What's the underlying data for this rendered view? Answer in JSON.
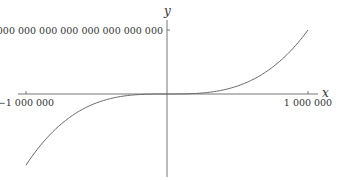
{
  "chart_data": {
    "type": "line",
    "title": "",
    "xlabel": "x",
    "ylabel": "y",
    "function": "y = c * x^3 (odd cubic-like curve)",
    "xlim": [
      -1000000,
      1000000
    ],
    "x_ticks": [
      {
        "value": -1000000,
        "label": "−1 000 000"
      },
      {
        "value": 1000000,
        "label": "1 000 000"
      }
    ],
    "y_ticks": [
      {
        "value": 900000000000000000000000000000,
        "label": "900 000 000 000 000 000 000 000 000 000"
      }
    ],
    "series": [
      {
        "name": "curve",
        "color": "#666666",
        "x_range": [
          -1000000,
          1000000
        ],
        "y_at_xmax": 900000000000000000000000000000,
        "y_at_xmin": -1000000000000000000000000000000
      }
    ],
    "grid": false,
    "legend": "none"
  }
}
